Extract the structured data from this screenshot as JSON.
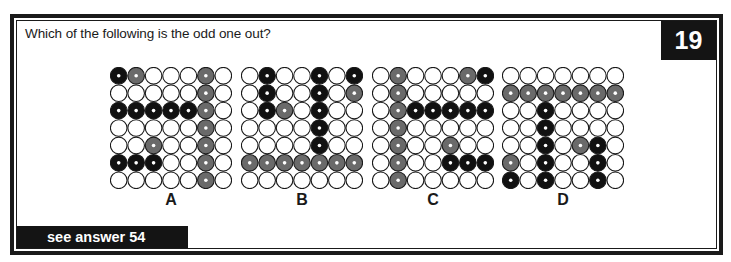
{
  "question": "Which of the following is the odd one out?",
  "puzzle_number": "19",
  "footer": "see answer 54",
  "colors": {
    "black": "#111111",
    "grey": "#6a6a6a",
    "white": "#ffffff",
    "outline": "#1a1a1a",
    "dot": "#ffffff"
  },
  "legend": {
    "W": "white",
    "G": "grey",
    "B": "black"
  },
  "options": [
    {
      "label": "A",
      "x": 110,
      "rows": [
        "BGWWWGW",
        "WWWWWGW",
        "BBBBBGW",
        "WWWWWGW",
        "WWGWWGW",
        "BBBWWGW",
        "WWWWWGW"
      ]
    },
    {
      "label": "B",
      "x": 241,
      "rows": [
        "WBWWBWB",
        "WBWWBWG",
        "WBGWBWW",
        "WWWWBWW",
        "WWWWBWW",
        "GGGGGGG",
        "WWWWWWW"
      ]
    },
    {
      "label": "C",
      "x": 372,
      "rows": [
        "WGWWWGB",
        "WGWWWWW",
        "WGBBBBB",
        "WGWWWWW",
        "WGWWGWW",
        "WGWWBBB",
        "WGWWWWW"
      ]
    },
    {
      "label": "D",
      "x": 502,
      "rows": [
        "WWWWWWW",
        "GGGGGGG",
        "WWBWWWW",
        "WWBWWWW",
        "WWBWGBW",
        "GWBWWBW",
        "BWBWWBW"
      ]
    }
  ]
}
